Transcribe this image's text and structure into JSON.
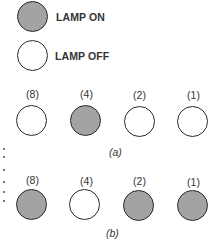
{
  "legend": {
    "on_label": "LAMP ON",
    "off_label": "LAMP OFF",
    "on_color": "#a3a3a3",
    "off_color": "#ffffff"
  },
  "figure_a": {
    "caption": "(a)",
    "weights": [
      "(8)",
      "(4)",
      "(2)",
      "(1)"
    ],
    "states": [
      "off",
      "on",
      "off",
      "off"
    ]
  },
  "figure_b": {
    "caption": "(b)",
    "weights": [
      "(8)",
      "(4)",
      "(2)",
      "(1)"
    ],
    "states": [
      "on",
      "off",
      "on",
      "on"
    ]
  }
}
